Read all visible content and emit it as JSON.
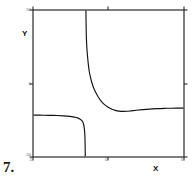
{
  "figure": {
    "number_label": "7.",
    "caption": ""
  },
  "axes": {
    "x_title": "X",
    "y_title": "Y",
    "x_ticks": [
      {
        "value": -5,
        "label": "-5",
        "px": 33
      },
      {
        "value": 0,
        "label": "0",
        "px": 108
      },
      {
        "value": 5,
        "label": "5",
        "px": 184
      }
    ],
    "y_ticks": [
      {
        "value": 50,
        "label": "50",
        "px": 10
      },
      {
        "value": 0,
        "label": "0",
        "px": 84
      },
      {
        "value": -50,
        "label": "-50",
        "px": 157
      }
    ],
    "frame_color": "#2b2b2b",
    "curve_color": "#111111"
  },
  "chart_data": {
    "type": "line",
    "title": "",
    "subtitle": "",
    "xlabel": "X",
    "ylabel": "Y",
    "xlim": [
      -5,
      5
    ],
    "ylim": [
      -50,
      50
    ],
    "grid": false,
    "legend": null,
    "annotations": [
      {
        "text": "vertical asymptote",
        "x": -1.5,
        "type": "asymptote"
      }
    ],
    "series": [
      {
        "name": "curve",
        "color": "#111111",
        "comment": "rational-type function: flat left branch near y=-22, plunges to -inf just left of x=-1.5, returns from +inf just right of x=-1.5, decays to a shallow local minimum near x=0.6 then rises asymptotically back toward y=-22",
        "x": [
          -5.0,
          -4.6,
          -4.2,
          -3.8,
          -3.4,
          -3.0,
          -2.7,
          -2.45,
          -2.25,
          -2.05,
          -1.9,
          -1.8,
          -1.72,
          -1.66,
          -1.61,
          -1.575,
          -1.555,
          -1.545,
          -1.54,
          -1.495,
          -1.488,
          -1.48,
          -1.47,
          -1.45,
          -1.42,
          -1.38,
          -1.33,
          -1.27,
          -1.2,
          -1.1,
          -1.0,
          -0.85,
          -0.7,
          -0.5,
          -0.3,
          -0.05,
          0.2,
          0.45,
          0.7,
          0.95,
          1.2,
          1.5,
          1.85,
          2.25,
          2.7,
          3.2,
          3.7,
          4.2,
          4.6,
          5.0
        ],
        "y": [
          -21.5,
          -21.5,
          -21.6,
          -21.7,
          -21.8,
          -22.0,
          -22.2,
          -22.5,
          -22.9,
          -23.4,
          -24.1,
          -24.9,
          -25.9,
          -27.4,
          -29.8,
          -33.5,
          -38.5,
          -44.0,
          -50.0,
          50.0,
          44.0,
          38.0,
          33.0,
          27.5,
          22.5,
          17.5,
          12.5,
          8.0,
          4.5,
          0.5,
          -2.5,
          -6.0,
          -8.8,
          -11.8,
          -14.0,
          -16.0,
          -17.4,
          -18.3,
          -18.8,
          -19.0,
          -18.9,
          -18.6,
          -18.2,
          -17.8,
          -17.4,
          -17.1,
          -16.9,
          -16.8,
          -16.75,
          -16.7
        ]
      }
    ]
  }
}
